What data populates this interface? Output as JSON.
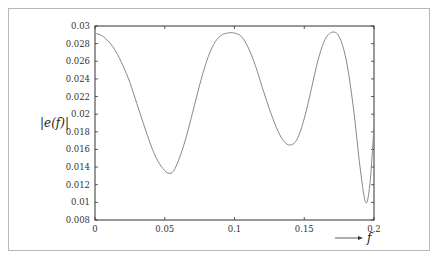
{
  "chart_data": {
    "type": "line",
    "title": "",
    "xlabel": "f",
    "ylabel": "|e(f)|",
    "xlim": [
      0,
      0.2
    ],
    "ylim": [
      0.008,
      0.03
    ],
    "grid": false,
    "legend": null,
    "x_ticks": [
      "0",
      "0.05",
      "0.1",
      "0.15",
      "0.2"
    ],
    "y_ticks": [
      "0.008",
      "0.01",
      "0.012",
      "0.014",
      "0.016",
      "0.018",
      "0.02",
      "0.022",
      "0.024",
      "0.026",
      "0.028",
      "0.03"
    ],
    "series": [
      {
        "name": "|e(f)|",
        "color": "#888888",
        "x": [
          0,
          0.005,
          0.01,
          0.015,
          0.02,
          0.025,
          0.03,
          0.035,
          0.04,
          0.045,
          0.05,
          0.053,
          0.056,
          0.06,
          0.065,
          0.07,
          0.075,
          0.08,
          0.085,
          0.09,
          0.095,
          0.1,
          0.105,
          0.11,
          0.115,
          0.12,
          0.125,
          0.13,
          0.135,
          0.14,
          0.145,
          0.15,
          0.155,
          0.16,
          0.165,
          0.17,
          0.175,
          0.18,
          0.185,
          0.19,
          0.194,
          0.197,
          0.2
        ],
        "values": [
          0.0292,
          0.0289,
          0.0282,
          0.0271,
          0.0255,
          0.0236,
          0.0212,
          0.0188,
          0.0165,
          0.0147,
          0.0136,
          0.0133,
          0.0135,
          0.0148,
          0.0172,
          0.0202,
          0.0233,
          0.026,
          0.0279,
          0.0289,
          0.0292,
          0.0292,
          0.0288,
          0.0275,
          0.0255,
          0.023,
          0.0206,
          0.0185,
          0.017,
          0.0165,
          0.0172,
          0.0195,
          0.0228,
          0.0262,
          0.0285,
          0.0293,
          0.0288,
          0.0262,
          0.021,
          0.014,
          0.01,
          0.012,
          0.0185
        ]
      }
    ]
  }
}
